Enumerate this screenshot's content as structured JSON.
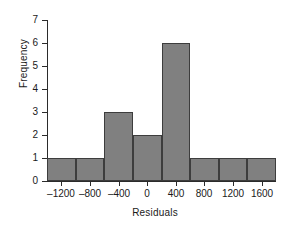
{
  "chart_data": {
    "type": "bar",
    "title": "",
    "xlabel": "Residuals",
    "ylabel": "Frequency",
    "bin_width": 400,
    "bin_edges": [
      -1400,
      -1000,
      -600,
      -200,
      200,
      600,
      1000,
      1400,
      1800
    ],
    "categories": [
      "-1400 to -1000",
      "-1000 to -600",
      "-600 to -200",
      "-200 to 200",
      "200 to 600",
      "600 to 1000",
      "1000 to 1400",
      "1400 to 1800"
    ],
    "values": [
      1,
      1,
      3,
      2,
      6,
      1,
      1,
      1
    ],
    "xlim": [
      -1400,
      1800
    ],
    "ylim": [
      0,
      7
    ],
    "xticks": [
      -1200,
      -800,
      -400,
      0,
      400,
      800,
      1200,
      1600
    ],
    "xtick_labels": [
      "–1200",
      "–800",
      "–400",
      "0",
      "400",
      "800",
      "1200",
      "1600"
    ],
    "yticks": [
      0,
      1,
      2,
      3,
      4,
      5,
      6,
      7
    ],
    "ytick_labels": [
      "0",
      "1",
      "2",
      "3",
      "4",
      "5",
      "6",
      "7"
    ],
    "grid": false,
    "legend": null,
    "bar_color": "#808080",
    "bar_edge_color": "#3d3d3d",
    "axis_color": "#2b2b2b",
    "background_color": "#ffffff"
  }
}
